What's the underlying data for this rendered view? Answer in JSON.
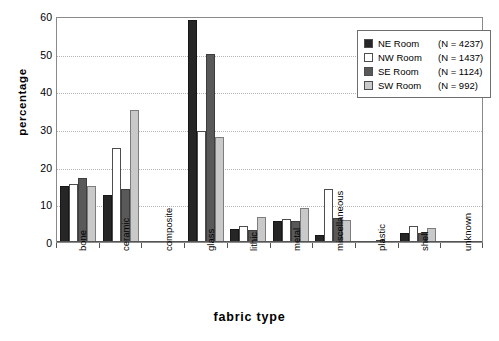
{
  "chart_data": {
    "type": "bar",
    "title": "",
    "xlabel": "fabric type",
    "ylabel": "percentage",
    "ylim": [
      0,
      60
    ],
    "yticks": [
      0,
      10,
      20,
      30,
      40,
      50,
      60
    ],
    "grid": true,
    "legend_position": "top-right",
    "categories": [
      "bone",
      "ceramic",
      "composite",
      "glass",
      "lithic",
      "metal",
      "miscellaneous",
      "plastic",
      "shell",
      "unknown"
    ],
    "series": [
      {
        "name": "NE Room",
        "n": 4237,
        "label": "NE Room  (N = 4237)",
        "color": "#262626",
        "values": [
          15.0,
          12.5,
          0.1,
          59.0,
          3.5,
          5.7,
          1.8,
          0.0,
          2.3,
          0.0
        ]
      },
      {
        "name": "NW Room",
        "n": 1437,
        "label": "NW Room (N = 1437)",
        "color": "#ffffff",
        "values": [
          15.3,
          25.0,
          0.0,
          29.5,
          4.3,
          6.0,
          14.0,
          0.0,
          4.3,
          0.0
        ]
      },
      {
        "name": "SE Room",
        "n": 1124,
        "label": "SE Room  (N = 1124)",
        "color": "#595959",
        "values": [
          17.0,
          14.0,
          0.0,
          50.0,
          3.3,
          5.7,
          6.3,
          0.5,
          2.5,
          0.2
        ]
      },
      {
        "name": "SW Room",
        "n": 992,
        "label": "SW Room (N = 992)",
        "color": "#c9c9c9",
        "values": [
          15.0,
          35.0,
          0.0,
          27.8,
          6.7,
          9.0,
          5.8,
          0.0,
          3.8,
          0.0
        ]
      }
    ]
  },
  "legend": {
    "rows": [
      {
        "name": "NE Room",
        "count": "(N = 4237)"
      },
      {
        "name": "NW Room",
        "count": "(N = 1437)"
      },
      {
        "name": "SE Room",
        "count": "(N = 1124)"
      },
      {
        "name": "SW Room",
        "count": "(N = 992)"
      }
    ]
  }
}
